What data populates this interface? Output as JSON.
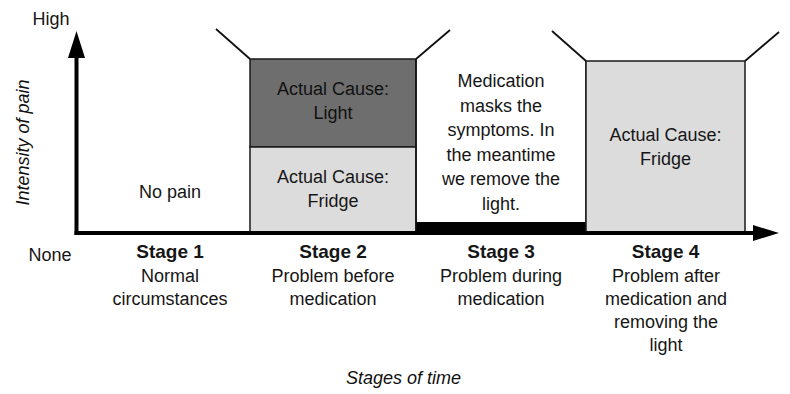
{
  "axes": {
    "y_label": "Intensity of pain",
    "y_high": "High",
    "y_low": "None",
    "x_label": "Stages of time"
  },
  "colors": {
    "dark_box": "#6e6e6e",
    "light_box": "#dcdcdc",
    "axis": "#000000",
    "medication_bar": "#000000"
  },
  "stages": [
    {
      "title": "Stage 1",
      "desc_lines": [
        "Normal",
        "circumstances"
      ],
      "content": "No pain"
    },
    {
      "title": "Stage 2",
      "desc_lines": [
        "Problem before",
        "medication"
      ],
      "boxes": [
        {
          "label_lines": [
            "Actual Cause:",
            "Light"
          ],
          "shade": "dark"
        },
        {
          "label_lines": [
            "Actual Cause:",
            "Fridge"
          ],
          "shade": "light"
        }
      ]
    },
    {
      "title": "Stage 3",
      "desc_lines": [
        "Problem during",
        "medication"
      ],
      "note_lines": [
        "Medication",
        "masks the",
        "symptoms. In",
        "the meantime",
        "we remove the",
        "light."
      ]
    },
    {
      "title": "Stage 4",
      "desc_lines": [
        "Problem after",
        "medication and",
        "removing the",
        "light"
      ],
      "boxes": [
        {
          "label_lines": [
            "Actual Cause:",
            "Fridge"
          ],
          "shade": "light"
        }
      ]
    }
  ]
}
